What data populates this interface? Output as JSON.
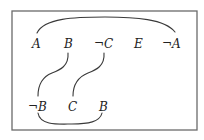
{
  "diagram": {
    "type": "resolution-diagram",
    "frame": {
      "x": 12,
      "y": 11,
      "width": 185,
      "height": 119
    },
    "top_clause": {
      "literals": [
        {
          "label": "A",
          "x": 37,
          "y": 48
        },
        {
          "label": "B",
          "x": 68,
          "y": 48
        },
        {
          "label": "¬C",
          "x": 104,
          "y": 48
        },
        {
          "label": "E",
          "x": 138,
          "y": 48
        },
        {
          "label": "¬A",
          "x": 172,
          "y": 48
        }
      ]
    },
    "bottom_clause": {
      "literals": [
        {
          "label": "¬B",
          "x": 40,
          "y": 111
        },
        {
          "label": "C",
          "x": 72,
          "y": 111
        },
        {
          "label": "B",
          "x": 103,
          "y": 111
        }
      ]
    },
    "links": [
      {
        "from": "A",
        "to": "¬A",
        "kind": "top-arc"
      },
      {
        "from": "B",
        "to": "¬B",
        "kind": "s-curve"
      },
      {
        "from": "¬C",
        "to": "C",
        "kind": "s-curve"
      },
      {
        "from": "¬B",
        "to": "B",
        "kind": "bottom-arc"
      }
    ],
    "colors": {
      "frame": "#6a6a6a",
      "lines": "#3a3a3a",
      "text": "#222222"
    }
  }
}
